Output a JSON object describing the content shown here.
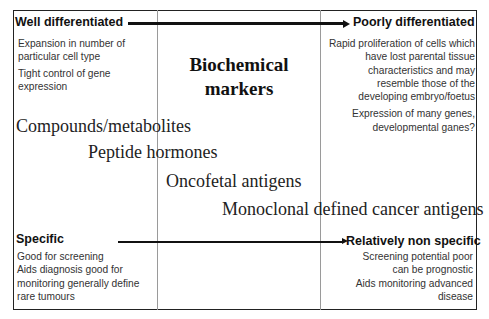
{
  "diagram": {
    "title": "Biochemical markers",
    "title_lines": [
      "Biochemical",
      "markers"
    ],
    "top_axis": {
      "left_label": "Well differentiated",
      "right_label": "Poorly differentiated",
      "direction": "left-to-right"
    },
    "left_top_notes": [
      "Expansion in number of",
      "particular cell type",
      "Tight control of gene",
      "expression"
    ],
    "right_top_notes": [
      "Rapid proliferation of cells which",
      "have lost parental tissue",
      "characteristics and may",
      "resemble those of the",
      "developing embryo/foetus",
      "Expression of many genes,",
      "developmental ganes?"
    ],
    "marker_classes": [
      "Compounds/metabolites",
      "Peptide hormones",
      "Oncofetal antigens",
      "Monoclonal defined cancer antigens"
    ],
    "bottom_axis": {
      "left_label": "Specific",
      "right_label": "Relatively non specific",
      "direction": "left-to-right"
    },
    "left_bottom_notes": [
      "Good for screening",
      "Aids diagnosis good for",
      "monitoring generally define",
      "rare tumours"
    ],
    "right_bottom_notes": [
      "Screening potential poor",
      "can be prognostic",
      "Aids monitoring advanced",
      "disease"
    ]
  }
}
